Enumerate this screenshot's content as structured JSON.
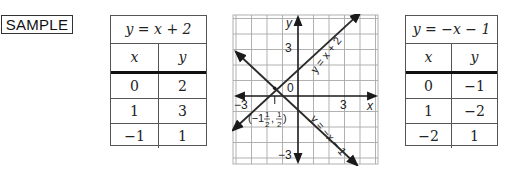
{
  "label": "SAMPLE",
  "table_left": {
    "title": "y = x + 2",
    "headers": [
      "x",
      "y"
    ],
    "rows": [
      [
        "0",
        "2"
      ],
      [
        "1",
        "3"
      ],
      [
        "−1",
        "1"
      ]
    ]
  },
  "table_right": {
    "title": "y = −x − 1",
    "headers": [
      "x",
      "y"
    ],
    "rows": [
      [
        "0",
        "−1"
      ],
      [
        "1",
        "−2"
      ],
      [
        "−2",
        "1"
      ]
    ]
  },
  "graph": {
    "x_axis_label": "x",
    "y_axis_label": "y",
    "origin_label": "0",
    "x_tick_neg": "−3",
    "x_tick_pos": "3",
    "y_tick_pos": "3",
    "y_tick_neg": "−3",
    "line1_label": "y = x + 2",
    "line2_label": "y = −x − 1",
    "intersection_label": "(−1½, ½)",
    "intersection_label_parts": {
      "open": "(−1",
      "num1": "1",
      "den1": "2",
      "comma": ",",
      "num2": "1",
      "den2": "2",
      "close": ")"
    },
    "colors": {
      "grid": "#9a9a9a",
      "axis": "#1a1a1a",
      "line": "#2a2a2a"
    }
  }
}
